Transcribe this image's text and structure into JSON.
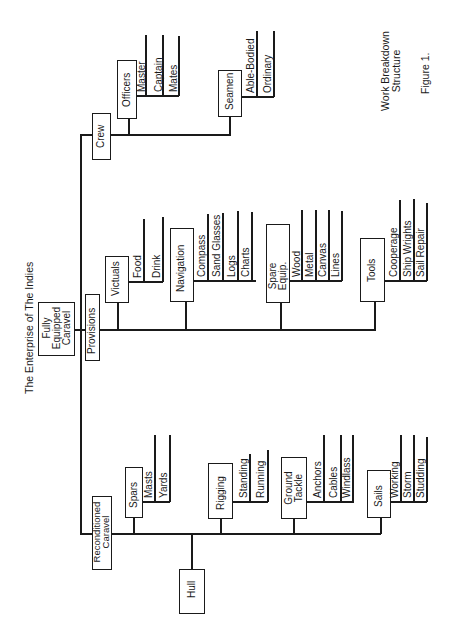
{
  "title": "The Enterprise of The Indies",
  "caption": {
    "line1": "Work Breakdown",
    "line2": "Structure",
    "figure": "Figure 1."
  },
  "root": {
    "line1": "Fully",
    "line2": "Equipped",
    "line3": "Caravel"
  },
  "branches": {
    "crew": {
      "label": "Crew",
      "officers": {
        "label": "Officers",
        "items": [
          "Master",
          "Captain",
          "Mates"
        ]
      },
      "seamen": {
        "label": "Seamen",
        "items": [
          "Able-Bodied",
          "Ordinary"
        ]
      }
    },
    "provisions": {
      "label": "Provisions",
      "victuals": {
        "label": "Victuals",
        "items": [
          "Food",
          "Drink"
        ]
      },
      "navigation": {
        "label": "Navigation",
        "items": [
          "Compass",
          "Sand Glasses",
          "Logs",
          "Charts"
        ]
      },
      "spare": {
        "line1": "Spare",
        "line2": "Equip.",
        "items": [
          "Wood",
          "Metal",
          "Canvas",
          "Lines"
        ]
      },
      "tools": {
        "label": "Tools",
        "items": [
          "Cooperage",
          "Ship Wrights",
          "Sail Repair"
        ]
      }
    },
    "reconditioned": {
      "line1": "Reconditioned",
      "line2": "Caravel",
      "hull": {
        "label": "Hull"
      },
      "spars": {
        "label": "Spars",
        "items": [
          "Masts",
          "Yards"
        ]
      },
      "rigging": {
        "label": "Rigging",
        "items": [
          "Standing",
          "Running"
        ]
      },
      "ground": {
        "line1": "Ground",
        "line2": "Tackle",
        "items": [
          "Anchors",
          "Cables",
          "Windlass"
        ]
      },
      "sails": {
        "label": "Sails",
        "items": [
          "Working",
          "Storm",
          "Studding"
        ]
      }
    }
  }
}
